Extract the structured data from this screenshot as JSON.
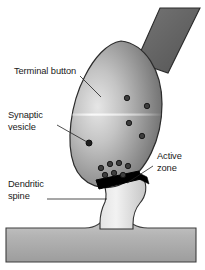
{
  "figure": {
    "background_color": "#ffffff"
  },
  "labels": {
    "terminal_button": {
      "text": "Terminal button",
      "lines": [
        "Terminal button"
      ],
      "x": 14,
      "y": 71
    },
    "synaptic_vesicle": {
      "text": "Synaptic vesicle",
      "lines": [
        "Synaptic",
        "vesicle"
      ],
      "line1": "Synaptic",
      "line2": "vesicle",
      "x": 8,
      "y": 118
    },
    "dendritic_spine": {
      "text": "Dendritic spine",
      "lines": [
        "Dendritic",
        "spine"
      ],
      "line1": "Dendritic",
      "line2": "spine",
      "x": 8,
      "y": 186
    },
    "active_zone": {
      "text": "Active zone",
      "lines": [
        "Active",
        "zone"
      ],
      "line1": "Active",
      "line2": "zone",
      "x": 157,
      "y": 158
    }
  },
  "structures": {
    "axon": {
      "name": "axon",
      "fill_top": "#6e6e6e",
      "fill_bottom": "#585858",
      "stroke": "#2b2b2b"
    },
    "terminal_button": {
      "name": "terminal button",
      "fill_light": "#dedede",
      "fill_mid": "#9a9a9a",
      "fill_dark": "#6a6a6a",
      "stroke": "#2b2b2b",
      "highlight": "#f2f2f2"
    },
    "active_zone": {
      "name": "active zone",
      "fill": "#000000",
      "stroke": "#000000"
    },
    "dendritic_spine": {
      "name": "dendritic spine",
      "fill_light": "#f0f0f0",
      "fill_mid": "#d2d2d2",
      "stroke": "#2b2b2b"
    },
    "dendrite_shaft": {
      "name": "dendrite shaft",
      "fill_light": "#c9c9c9",
      "fill_mid": "#a8a8a8",
      "stroke": "#3a3a3a"
    }
  },
  "vesicles": {
    "fill": "#3a3a3a",
    "stroke": "#141414",
    "radius": 2.6,
    "free": [
      {
        "cx": 127,
        "cy": 98
      },
      {
        "cx": 147,
        "cy": 106
      },
      {
        "cx": 129,
        "cy": 123
      },
      {
        "cx": 142,
        "cy": 136
      }
    ],
    "docked": [
      {
        "cx": 101,
        "cy": 168
      },
      {
        "cx": 110,
        "cy": 165
      },
      {
        "cx": 119,
        "cy": 164
      },
      {
        "cx": 128,
        "cy": 167
      },
      {
        "cx": 106,
        "cy": 175
      },
      {
        "cx": 115,
        "cy": 174
      },
      {
        "cx": 124,
        "cy": 176
      }
    ],
    "pointed": {
      "cx": 89,
      "cy": 143
    }
  },
  "leaders": {
    "terminal_button": "M 80 76 L 101 97",
    "synaptic_vesicle": "M 56 125 L 86 143",
    "dendritic_spine": "M 46 199 L 106 199",
    "active_zone": "M 152 167 L 126 184"
  }
}
